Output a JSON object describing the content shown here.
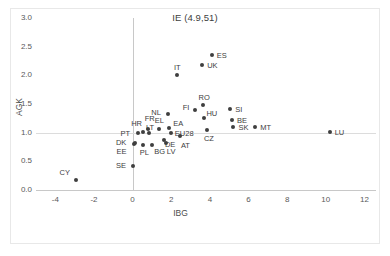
{
  "chart_data": {
    "type": "scatter",
    "title": "IE (4.9,51)",
    "xlabel": "IBG",
    "ylabel": "AGK",
    "xlim": [
      -5,
      12.6
    ],
    "ylim": [
      0,
      3.0
    ],
    "xticks": [
      -4,
      -2,
      0,
      2,
      4,
      6,
      8,
      10,
      12
    ],
    "yticks": [
      "0.0",
      "0.5",
      "1.0",
      "1.5",
      "2.0",
      "2.5",
      "3.0"
    ],
    "ytick_values": [
      0,
      0.5,
      1.0,
      1.5,
      2.0,
      2.5,
      3.0
    ],
    "grid": false,
    "legend": "none",
    "point_color": "#3f3f3f",
    "axis_color": "#c8c8c8",
    "annotations": [
      "IE (4.9,51)"
    ],
    "points": [
      {
        "label": "CY",
        "x": -2.95,
        "y": 0.18,
        "lx": -16,
        "ly": -11
      },
      {
        "label": "SE",
        "x": 0.02,
        "y": 0.42,
        "lx": -17,
        "ly": -4
      },
      {
        "label": "EE",
        "x": 0.05,
        "y": 0.8,
        "lx": -17,
        "ly": 4
      },
      {
        "label": "DK",
        "x": 0.12,
        "y": 0.82,
        "lx": -19,
        "ly": -4
      },
      {
        "label": "PT",
        "x": 0.3,
        "y": 1.0,
        "lx": -18,
        "ly": -3
      },
      {
        "label": "PL",
        "x": 0.52,
        "y": 0.78,
        "lx": -3,
        "ly": 4
      },
      {
        "label": "HR",
        "x": 0.55,
        "y": 1.02,
        "lx": -12,
        "ly": -12
      },
      {
        "label": "FR",
        "x": 0.78,
        "y": 1.06,
        "lx": -3,
        "ly": -14
      },
      {
        "label": "LT",
        "x": 0.85,
        "y": 1.0,
        "lx": -3,
        "ly": -9
      },
      {
        "label": "BG",
        "x": 1.02,
        "y": 0.78,
        "lx": 2,
        "ly": 3
      },
      {
        "label": "EL",
        "x": 1.35,
        "y": 1.06,
        "lx": -4,
        "ly": -12
      },
      {
        "label": "DE",
        "x": 1.62,
        "y": 0.88,
        "lx": 1,
        "ly": 1
      },
      {
        "label": "LV",
        "x": 1.72,
        "y": 0.82,
        "lx": 1,
        "ly": 5
      },
      {
        "label": "EA",
        "x": 1.9,
        "y": 1.08,
        "lx": 4,
        "ly": -8
      },
      {
        "label": "EU28",
        "x": 1.98,
        "y": 1.0,
        "lx": 4,
        "ly": -3
      },
      {
        "label": "AT",
        "x": 2.45,
        "y": 0.95,
        "lx": 1,
        "ly": 6
      },
      {
        "label": "NL",
        "x": 1.85,
        "y": 1.32,
        "lx": -17,
        "ly": -5
      },
      {
        "label": "IT",
        "x": 2.3,
        "y": 2.0,
        "lx": -3,
        "ly": -11
      },
      {
        "label": "FI",
        "x": 3.22,
        "y": 1.4,
        "lx": -12,
        "ly": -6
      },
      {
        "label": "RO",
        "x": 3.62,
        "y": 1.48,
        "lx": -4,
        "ly": -11
      },
      {
        "label": "HU",
        "x": 3.72,
        "y": 1.25,
        "lx": 2,
        "ly": -8
      },
      {
        "label": "CZ",
        "x": 3.85,
        "y": 1.05,
        "lx": -3,
        "ly": 5
      },
      {
        "label": "UK",
        "x": 3.6,
        "y": 2.18,
        "lx": 5,
        "ly": -3
      },
      {
        "label": "ES",
        "x": 4.1,
        "y": 2.35,
        "lx": 5,
        "ly": -3
      },
      {
        "label": "SI",
        "x": 5.05,
        "y": 1.42,
        "lx": 5,
        "ly": -3
      },
      {
        "label": "BE",
        "x": 5.15,
        "y": 1.22,
        "lx": 5,
        "ly": -3
      },
      {
        "label": "SK",
        "x": 5.22,
        "y": 1.1,
        "lx": 5,
        "ly": -3
      },
      {
        "label": "MT",
        "x": 6.35,
        "y": 1.1,
        "lx": 5,
        "ly": -3
      },
      {
        "label": "LU",
        "x": 10.2,
        "y": 1.02,
        "lx": 5,
        "ly": -3
      }
    ]
  }
}
